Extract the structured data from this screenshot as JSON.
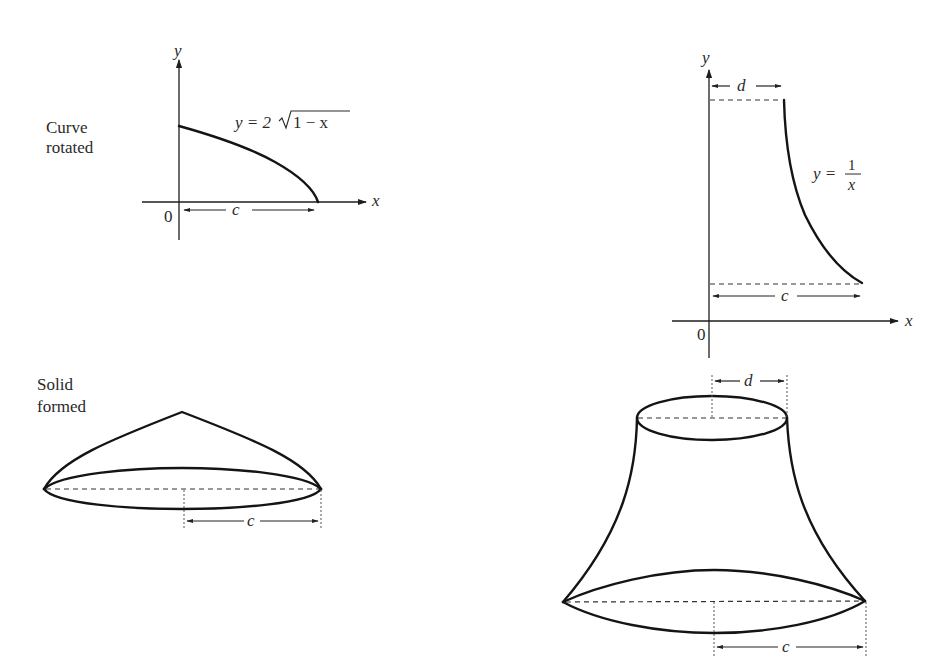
{
  "labels": {
    "curve_rotated_line1": "Curve",
    "curve_rotated_line2": "rotated",
    "solid_formed_line1": "Solid",
    "solid_formed_line2": "formed"
  },
  "left_graph": {
    "equation_prefix": "y = 2",
    "equation_radicand": "1 − x",
    "x_axis_label": "x",
    "y_axis_label": "y",
    "origin_label": "0",
    "dimension_label": "c"
  },
  "right_graph": {
    "equation_lhs": "y =",
    "equation_numerator": "1",
    "equation_denominator": "x",
    "x_axis_label": "x",
    "y_axis_label": "y",
    "origin_label": "0",
    "top_dimension_label": "d",
    "bottom_dimension_label": "c"
  },
  "left_solid": {
    "dimension_label": "c"
  },
  "right_solid": {
    "top_dimension_label": "d",
    "bottom_dimension_label": "c"
  },
  "colors": {
    "ink": "#141414",
    "background": "#ffffff"
  }
}
